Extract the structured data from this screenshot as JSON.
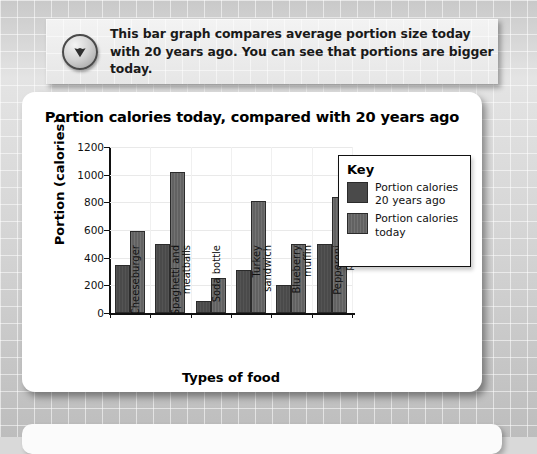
{
  "banner": {
    "icon": "chevron-down-circle-icon",
    "text": "This bar graph compares average portion size today with 20 years ago. You can see that portions are bigger today."
  },
  "colors": {
    "bar_old": "#4a4a4a",
    "bar_today": "#626262",
    "axis": "#111111",
    "card_background": "#ffffff",
    "page_background": "#dcdcdc"
  },
  "key": {
    "title": "Key",
    "entries": [
      {
        "label": "Portion calories 20 years ago",
        "series": "old"
      },
      {
        "label": "Portion calories today",
        "series": "today"
      }
    ]
  },
  "chart_data": {
    "type": "bar",
    "title": "Portion calories today, compared with 20 years ago",
    "xlabel": "Types of food",
    "ylabel": "Portion (calories)",
    "ylim": [
      0,
      1200
    ],
    "yticks": [
      0,
      200,
      400,
      600,
      800,
      1000,
      1200
    ],
    "grid": true,
    "legend_position": "inside-top-right",
    "categories": [
      "Cheeseburger",
      "Spaghetti and meatballs",
      "Soda bottle",
      "Turkey sandwich",
      "Blueberry muffin",
      "Pepperoni pizza"
    ],
    "category_lines": [
      [
        "Cheeseburger"
      ],
      [
        "Spaghetti and",
        "meatballs"
      ],
      [
        "Soda bottle"
      ],
      [
        "Turkey",
        "sandwich"
      ],
      [
        "Blueberry",
        "muffin"
      ],
      [
        "Pepperoni",
        "pizza"
      ]
    ],
    "series": [
      {
        "name": "Portion calories 20 years ago",
        "values": [
          350,
          500,
          85,
          310,
          200,
          500
        ]
      },
      {
        "name": "Portion calories today",
        "values": [
          590,
          1020,
          250,
          810,
          500,
          840
        ]
      }
    ]
  }
}
